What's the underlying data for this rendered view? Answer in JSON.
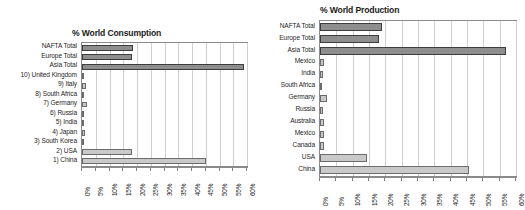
{
  "figure": {
    "background": "#ffffff",
    "bar_color_total": "#8e8e8e",
    "bar_color_country": "#c9c9c9",
    "grid_color": "#cfcfcf",
    "axis_color": "#8a8a8a"
  },
  "chart_data": [
    {
      "type": "bar",
      "orientation": "horizontal",
      "id": "consumption",
      "title": "% World Consumption",
      "xlabel": "",
      "ylabel": "",
      "xlim": [
        0,
        60
      ],
      "xticks": [
        0,
        5,
        10,
        15,
        20,
        25,
        30,
        35,
        40,
        45,
        50,
        55,
        60
      ],
      "xtick_labels": [
        "0%",
        "5%",
        "10%",
        "15%",
        "20%",
        "25%",
        "30%",
        "35%",
        "40%",
        "45%",
        "50%",
        "55%",
        "60%"
      ],
      "grid": true,
      "legend": "none",
      "categories": [
        "NAFTA Total",
        "Europe Total",
        "Asia Total",
        "10) United Kingdom",
        "9) Italy",
        "8) South Africa",
        "7) Germany",
        "6) Russia",
        "5) India",
        "4) Japan",
        "3) South Korea",
        "2) USA",
        "1) China"
      ],
      "values": [
        18.5,
        18.0,
        59.0,
        0.7,
        1.4,
        0.4,
        1.7,
        0.5,
        0.9,
        1.0,
        0.6,
        18.0,
        45.0
      ],
      "series_kind": [
        "total",
        "total",
        "total",
        "country",
        "country",
        "country",
        "country",
        "country",
        "country",
        "country",
        "country",
        "country",
        "country"
      ]
    },
    {
      "type": "bar",
      "orientation": "horizontal",
      "id": "production",
      "title": "% World Production",
      "xlabel": "",
      "ylabel": "",
      "xlim": [
        0,
        60
      ],
      "xticks": [
        0,
        5,
        10,
        15,
        20,
        25,
        30,
        35,
        40,
        45,
        50,
        55,
        60
      ],
      "xtick_labels": [
        "0%",
        "5%",
        "10%",
        "15%",
        "20%",
        "25%",
        "30%",
        "35%",
        "40%",
        "45%",
        "50%",
        "55%",
        "60%"
      ],
      "grid": true,
      "legend": "none",
      "categories": [
        "NAFTA Total",
        "Europe Total",
        "Asia Total",
        "Mexico",
        "India",
        "South Africa",
        "Germany",
        "Russia",
        "Australia",
        "Mexico",
        "Canada",
        "USA",
        "China"
      ],
      "values": [
        19.0,
        18.0,
        57.0,
        1.3,
        0.8,
        0.3,
        2.0,
        0.8,
        1.1,
        1.3,
        1.3,
        14.5,
        45.5
      ],
      "series_kind": [
        "total",
        "total",
        "total",
        "country",
        "country",
        "country",
        "country",
        "country",
        "country",
        "country",
        "country",
        "country",
        "country"
      ]
    }
  ]
}
